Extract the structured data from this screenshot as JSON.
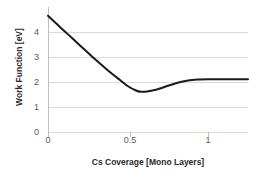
{
  "chart_data": {
    "type": "line",
    "title": "",
    "xlabel": "Cs Coverage [Mono Layers]",
    "ylabel": "Work Function [eV]",
    "xlim": [
      0,
      1.25
    ],
    "ylim": [
      0,
      4.8
    ],
    "xticks": [
      "0",
      "0.5",
      "1"
    ],
    "xtick_values": [
      0,
      0.5,
      1
    ],
    "yticks": [
      "0",
      "1",
      "2",
      "3",
      "4"
    ],
    "ytick_values": [
      0,
      1,
      2,
      3,
      4
    ],
    "grid": "horizontal",
    "legend": "none",
    "series": [
      {
        "name": "Work Function",
        "color": "#1a1a1a",
        "x": [
          0.0,
          0.05,
          0.1,
          0.15,
          0.2,
          0.25,
          0.3,
          0.35,
          0.4,
          0.45,
          0.5,
          0.55,
          0.58,
          0.62,
          0.66,
          0.7,
          0.75,
          0.8,
          0.85,
          0.9,
          0.95,
          1.0,
          1.05,
          1.1,
          1.15,
          1.2,
          1.25
        ],
        "y": [
          4.65,
          4.35,
          4.05,
          3.76,
          3.46,
          3.17,
          2.88,
          2.6,
          2.33,
          2.08,
          1.83,
          1.66,
          1.61,
          1.62,
          1.67,
          1.74,
          1.85,
          1.95,
          2.03,
          2.08,
          2.1,
          2.11,
          2.11,
          2.11,
          2.11,
          2.11,
          2.11
        ]
      }
    ],
    "annotations": {
      "start_value": 4.65,
      "minimum_value": 1.6,
      "minimum_x": 0.58,
      "plateau_value": 2.1
    },
    "colors": {
      "line": "#1a1a1a",
      "grid": "#d9d9d9",
      "axis": "#bfbfbf",
      "tick_text": "#595959",
      "label_text": "#2b2b2b",
      "background": "#ffffff"
    }
  }
}
